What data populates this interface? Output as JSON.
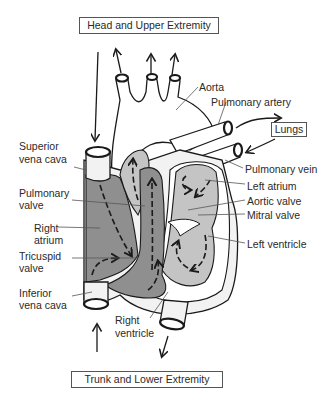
{
  "diagram": {
    "type": "anatomical-diagram",
    "regions": {
      "top": "Head and Upper Extremity",
      "bottom": "Trunk and Lower Extremity",
      "lungs": "Lungs"
    },
    "labels": {
      "aorta": "Aorta",
      "pulmonary_artery": "Pulmonary artery",
      "superior_vena_cava_1": "Superior",
      "superior_vena_cava_2": "vena cava",
      "pulmonary_valve_1": "Pulmonary",
      "pulmonary_valve_2": "valve",
      "right_atrium_1": "Right",
      "right_atrium_2": "atrium",
      "tricuspid_valve_1": "Tricuspid",
      "tricuspid_valve_2": "valve",
      "inferior_vena_cava_1": "Inferior",
      "inferior_vena_cava_2": "vena cava",
      "right_ventricle_1": "Right",
      "right_ventricle_2": "ventricle",
      "pulmonary_vein": "Pulmonary vein",
      "left_atrium": "Left atrium",
      "aortic_valve": "Aortic valve",
      "mitral_valve": "Mitral valve",
      "left_ventricle": "Left ventricle"
    },
    "colors": {
      "deoxygenated": "#8f8f8f",
      "oxygenated": "#c4c4c4",
      "vessel_wall": "#f2f2f2",
      "outline": "#1a1a1a",
      "leader": "#555555"
    }
  }
}
